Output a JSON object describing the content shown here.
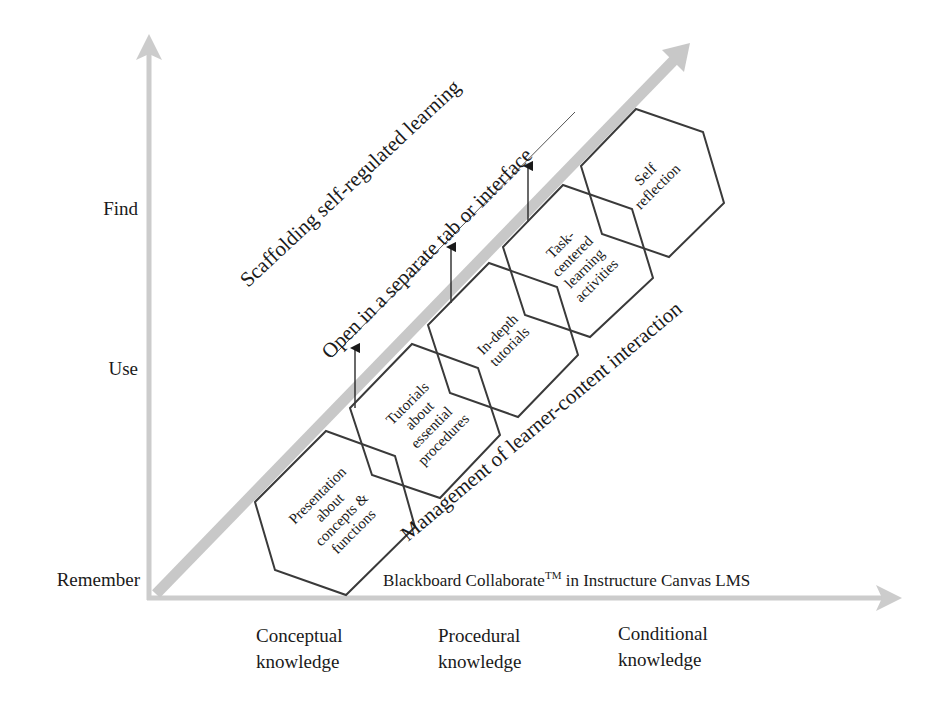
{
  "diagram": {
    "colors": {
      "axis": "#cccccc",
      "band": "#c8c8c8",
      "hex_stroke": "#3a3a3a",
      "text": "#1a1a1a"
    },
    "y_axis": {
      "levels": [
        "Remember",
        "Use",
        "Find"
      ]
    },
    "x_axis": {
      "caption_prefix": "Blackboard Collaborate",
      "caption_tm": "TM",
      "caption_suffix": " in Instructure Canvas LMS",
      "categories": [
        {
          "line1": "Conceptual",
          "line2": "knowledge"
        },
        {
          "line1": "Procedural",
          "line2": "knowledge"
        },
        {
          "line1": "Conditional",
          "line2": "knowledge"
        }
      ]
    },
    "diagonal_labels": {
      "scaffolding": "Scaffolding self-regulated learning",
      "open_separate": "Open in a separate tab or interface",
      "management": "Management of learner-content interaction"
    },
    "hexagons": [
      {
        "lines": [
          "Presentation",
          "about",
          "concepts &",
          "functions"
        ]
      },
      {
        "lines": [
          "Tutorials",
          "about",
          "essential",
          "procedures"
        ]
      },
      {
        "lines": [
          "In-depth",
          "tutorials"
        ]
      },
      {
        "lines": [
          "Task-",
          "centered",
          "learning",
          "activities"
        ]
      },
      {
        "lines": [
          "Self",
          "reflection"
        ]
      }
    ]
  }
}
